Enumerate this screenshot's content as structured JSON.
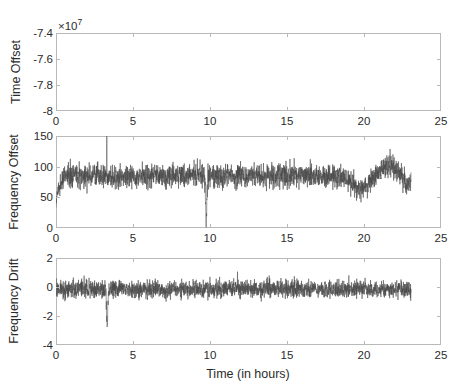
{
  "figure": {
    "background": "#ffffff",
    "trace_color": "#4a4a4a",
    "axis_color": "#b9b9b9",
    "text_color": "#2b2b2b",
    "xlabel": "Time (in hours)"
  },
  "chart_data": [
    {
      "type": "line",
      "title": "",
      "xlabel": "",
      "ylabel": "Time Offset",
      "y_exponent_label": "×10",
      "y_exponent_power": "7",
      "xlim": [
        0,
        25
      ],
      "ylim": [
        -8.0,
        -7.4
      ],
      "xticks": [
        0,
        5,
        10,
        15,
        20,
        25
      ],
      "xticklabels": [
        "0",
        "5",
        "10",
        "15",
        "20",
        "25"
      ],
      "yticks": [
        -8.0,
        -7.8,
        -7.6,
        -7.4
      ],
      "yticklabels": [
        "-8",
        "-7.8",
        "-7.6",
        "-7.4"
      ],
      "grid": false,
      "legend": "none",
      "series": [
        {
          "name": "Time Offset",
          "x": [
            0,
            1,
            2,
            3,
            4,
            5,
            6,
            7,
            8,
            9,
            10,
            11,
            12,
            13,
            14,
            15,
            16,
            17,
            18,
            19,
            20,
            21,
            22,
            23
          ],
          "y": [
            -74050000,
            -74310000,
            -74570000,
            -74830000,
            -75090000,
            -75350000,
            -75610000,
            -75870000,
            -76130000,
            -76390000,
            -76650000,
            -76910000,
            -77170000,
            -77430000,
            -77690000,
            -77950000,
            -78210000,
            -78470000,
            -78730000,
            -78990000,
            -79250000,
            -79510000,
            -79770000,
            -80030000
          ]
        }
      ]
    },
    {
      "type": "line",
      "title": "",
      "xlabel": "",
      "ylabel": "Frequency Offset",
      "xlim": [
        0,
        25
      ],
      "ylim": [
        0,
        150
      ],
      "xticks": [
        0,
        5,
        10,
        15,
        20,
        25
      ],
      "xticklabels": [
        "0",
        "5",
        "10",
        "15",
        "20",
        "25"
      ],
      "yticks": [
        0,
        50,
        100,
        150
      ],
      "yticklabels": [
        "0",
        "50",
        "100",
        "150"
      ],
      "grid": false,
      "legend": "none",
      "noise": {
        "description": "dense noisy band of per-second samples",
        "baseline_mean": 85,
        "band_half_width": 22,
        "start_ramp": {
          "from": 35,
          "to": 85,
          "over_hours": 0.6
        },
        "events": [
          {
            "kind": "spike-up",
            "x": 3.3,
            "peak": 150
          },
          {
            "kind": "spike-down",
            "x": 9.75,
            "trough": 8
          },
          {
            "kind": "dip",
            "x_start": 18.9,
            "x_end": 20.6,
            "level": 63
          },
          {
            "kind": "bump",
            "x_start": 20.8,
            "x_end": 22.4,
            "level": 104
          },
          {
            "kind": "drop-end",
            "x": 22.8,
            "level": 70
          }
        ],
        "x_end": 23.05
      }
    },
    {
      "type": "line",
      "title": "",
      "xlabel": "Time (in hours)",
      "ylabel": "Frequency Drift",
      "xlim": [
        0,
        25
      ],
      "ylim": [
        -4,
        2
      ],
      "xticks": [
        0,
        5,
        10,
        15,
        20,
        25
      ],
      "xticklabels": [
        "0",
        "5",
        "10",
        "15",
        "20",
        "25"
      ],
      "yticks": [
        -4,
        -2,
        0,
        2
      ],
      "yticklabels": [
        "-4",
        "-2",
        "0",
        "2"
      ],
      "grid": false,
      "legend": "none",
      "noise": {
        "description": "dense noisy band centred just below zero",
        "baseline_mean": -0.15,
        "band_half_width": 0.72,
        "events": [
          {
            "kind": "spike-down",
            "x": 3.32,
            "trough": -2.6
          }
        ],
        "x_end": 23.05
      }
    }
  ]
}
